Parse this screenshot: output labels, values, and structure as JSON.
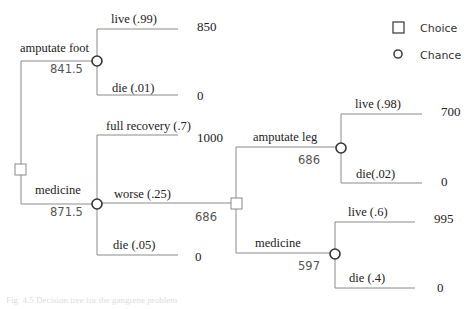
{
  "legend": {
    "choice_label": "Choice",
    "chance_label": "Chance"
  },
  "tree": {
    "root": {
      "type": "choice",
      "options": [
        {
          "label": "amputate foot",
          "expected_value": "841.5",
          "type": "chance",
          "outcomes": [
            {
              "label": "live (.99)",
              "value": "850"
            },
            {
              "label": "die (.01)",
              "value": "0"
            }
          ]
        },
        {
          "label": "medicine",
          "expected_value": "871.5",
          "type": "chance",
          "outcomes": [
            {
              "label": "full recovery (.7)",
              "value": "1000"
            },
            {
              "label": "worse (.25)",
              "value": "686"
            },
            {
              "label": "die (.05)",
              "value": "0"
            }
          ]
        }
      ]
    },
    "worse_choice": {
      "type": "choice",
      "options": [
        {
          "label": "amputate leg",
          "expected_value": "686",
          "type": "chance",
          "outcomes": [
            {
              "label": "live (.98)",
              "value": "700"
            },
            {
              "label": "die(.02)",
              "value": "0"
            }
          ]
        },
        {
          "label": "medicine",
          "expected_value": "597",
          "type": "chance",
          "outcomes": [
            {
              "label": "live (.6)",
              "value": "995"
            },
            {
              "label": "die (.4)",
              "value": "0"
            }
          ]
        }
      ]
    }
  },
  "caption": "Fig. 4.5 Decision tree for the gangrene problem"
}
